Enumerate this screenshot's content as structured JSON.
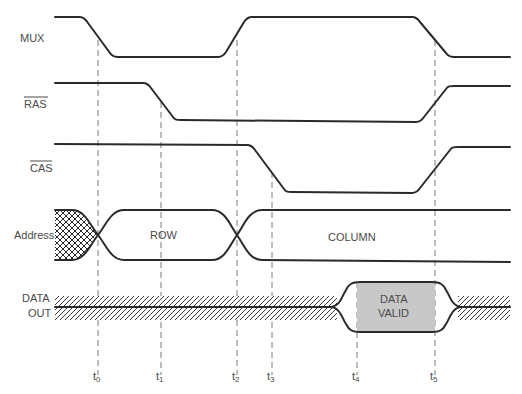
{
  "diagram": {
    "signals": [
      {
        "id": "mux",
        "label": "MUX",
        "overbar": false
      },
      {
        "id": "ras",
        "label": "RAS",
        "overbar": true
      },
      {
        "id": "cas",
        "label": "CAS",
        "overbar": true
      },
      {
        "id": "address",
        "label": "Address",
        "overbar": false
      },
      {
        "id": "data_out",
        "label_line1": "DATA",
        "label_line2": "OUT",
        "overbar": false
      }
    ],
    "bus_labels": {
      "row": "ROW",
      "column": "COLUMN",
      "data_valid_line1": "DATA",
      "data_valid_line2": "VALID"
    },
    "time_markers": [
      {
        "base": "t",
        "sub": "0",
        "x": 98
      },
      {
        "base": "t",
        "sub": "1",
        "x": 161
      },
      {
        "base": "t",
        "sub": "2",
        "x": 237
      },
      {
        "base": "t",
        "sub": "3",
        "x": 272
      },
      {
        "base": "t",
        "sub": "4",
        "x": 357
      },
      {
        "base": "t",
        "sub": "5",
        "x": 435
      }
    ],
    "colors": {
      "line": "#2a2a2a",
      "dashed": "#7a7a7a",
      "data_valid_fill": "#c8c8c8",
      "text": "#4a4a4a"
    }
  }
}
